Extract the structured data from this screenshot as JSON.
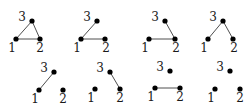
{
  "figure": {
    "node_color": "#000000",
    "edge_color": "#3a3a3a",
    "graphs": [
      {
        "id": "g1",
        "nodes": {
          "1": [
            16,
            39
          ],
          "2": [
            40,
            39
          ],
          "3": [
            32,
            21
          ]
        },
        "labels": {
          "1": [
            12,
            52,
            "1"
          ],
          "2": [
            40,
            52,
            "2"
          ],
          "3": [
            22,
            21,
            "3"
          ]
        },
        "edges": [
          [
            "1",
            "2"
          ],
          [
            "1",
            "3"
          ],
          [
            "2",
            "3"
          ]
        ]
      },
      {
        "id": "g2",
        "nodes": {
          "1": [
            81,
            39
          ],
          "2": [
            105,
            39
          ],
          "3": [
            97,
            21
          ]
        },
        "labels": {
          "1": [
            77,
            52,
            "1"
          ],
          "2": [
            106,
            52,
            "2"
          ],
          "3": [
            87,
            21,
            "3"
          ]
        },
        "edges": [
          [
            "1",
            "2"
          ],
          [
            "1",
            "3"
          ]
        ]
      },
      {
        "id": "g3",
        "nodes": {
          "1": [
            149,
            39
          ],
          "2": [
            175,
            39
          ],
          "3": [
            165,
            21
          ]
        },
        "labels": {
          "1": [
            145,
            52,
            "1"
          ],
          "2": [
            176,
            52,
            "2"
          ],
          "3": [
            155,
            21,
            "3"
          ]
        },
        "edges": [
          [
            "1",
            "2"
          ],
          [
            "2",
            "3"
          ]
        ]
      },
      {
        "id": "g4",
        "nodes": {
          "1": [
            208,
            39
          ],
          "2": [
            233,
            39
          ],
          "3": [
            223,
            21
          ]
        },
        "labels": {
          "1": [
            204,
            52,
            "1"
          ],
          "2": [
            234,
            52,
            "2"
          ],
          "3": [
            213,
            21,
            "3"
          ]
        },
        "edges": [
          [
            "1",
            "3"
          ],
          [
            "2",
            "3"
          ]
        ]
      },
      {
        "id": "g5",
        "nodes": {
          "1": [
            39,
            90
          ],
          "2": [
            63,
            90
          ],
          "3": [
            54,
            72
          ]
        },
        "labels": {
          "1": [
            35,
            103,
            "1"
          ],
          "2": [
            63,
            103,
            "2"
          ],
          "3": [
            44,
            72,
            "3"
          ]
        },
        "edges": [
          [
            "1",
            "3"
          ]
        ]
      },
      {
        "id": "g6",
        "nodes": {
          "1": [
            95,
            89
          ],
          "2": [
            120,
            89
          ],
          "3": [
            110,
            72
          ]
        },
        "labels": {
          "1": [
            91,
            102,
            "1"
          ],
          "2": [
            120,
            102,
            "2"
          ],
          "3": [
            100,
            72,
            "3"
          ]
        },
        "edges": [
          [
            "2",
            "3"
          ]
        ]
      },
      {
        "id": "g7",
        "nodes": {
          "1": [
            155,
            88
          ],
          "2": [
            180,
            88
          ],
          "3": [
            170,
            71
          ]
        },
        "labels": {
          "1": [
            151,
            101,
            "1"
          ],
          "2": [
            180,
            101,
            "2"
          ],
          "3": [
            160,
            71,
            "3"
          ]
        },
        "edges": [
          [
            "1",
            "2"
          ]
        ]
      },
      {
        "id": "g8",
        "nodes": {
          "1": [
            215,
            89
          ],
          "2": [
            240,
            89
          ],
          "3": [
            230,
            71
          ]
        },
        "labels": {
          "1": [
            211,
            102,
            "1"
          ],
          "2": [
            240,
            102,
            "2"
          ],
          "3": [
            220,
            71,
            "3"
          ]
        },
        "edges": []
      }
    ]
  }
}
